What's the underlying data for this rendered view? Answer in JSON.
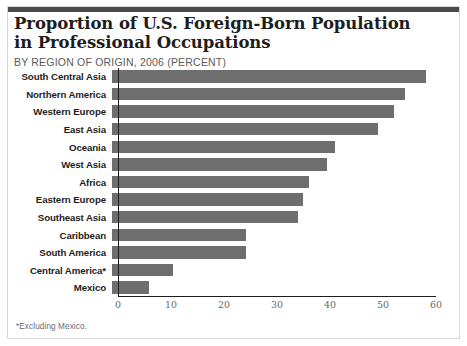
{
  "header": {
    "title_line1": "Proportion of U.S. Foreign-Born Population",
    "title_line2": "in Professional Occupations",
    "subtitle": "BY REGION OF ORIGIN, 2006 (PERCENT)"
  },
  "footnote": "*Excluding Mexico.",
  "colors": {
    "bar": "#6e6e6e",
    "axis": "#1d1d1d",
    "rule": "#4a4a4a",
    "frame": "#d8d8d8",
    "tick_text": "#6a6a6a",
    "label_text": "#1d1d1d",
    "subtitle_text": "#5a5a5a"
  },
  "chart_data": {
    "type": "bar",
    "orientation": "horizontal",
    "title": "Proportion of U.S. Foreign-Born Population in Professional Occupations",
    "subtitle": "BY REGION OF ORIGIN, 2006 (PERCENT)",
    "xlabel": "",
    "ylabel": "",
    "xlim": [
      0,
      60
    ],
    "xticks": [
      0,
      10,
      20,
      30,
      40,
      50,
      60
    ],
    "tick_labels": [
      "0",
      "10",
      "20",
      "30",
      "40",
      "50",
      "60"
    ],
    "grid": false,
    "legend": false,
    "units": "percent",
    "categories": [
      "South Central Asia",
      "Northern America",
      "Western Europe",
      "East Asia",
      "Oceania",
      "West Asia",
      "Africa",
      "Eastern Europe",
      "Southeast Asia",
      "Caribbean",
      "South America",
      "Central America*",
      "Mexico"
    ],
    "values": [
      59.3,
      55.2,
      53.2,
      50.2,
      42.1,
      40.5,
      37.2,
      36.0,
      35.0,
      25.2,
      25.2,
      11.5,
      7.0
    ]
  }
}
